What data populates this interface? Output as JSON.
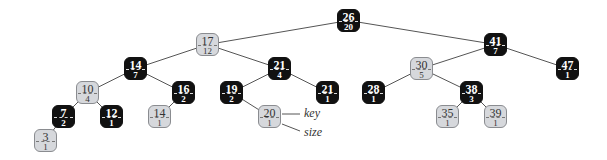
{
  "diagram": {
    "type": "red-black BST with subtree sizes",
    "colors": {
      "black_node": "#111111",
      "light_node": "#d6d8dc",
      "edge": "#555555"
    },
    "nodes": [
      {
        "id": "n26",
        "key": "26",
        "size": "20",
        "color": "black",
        "x": 337,
        "y": 9
      },
      {
        "id": "n17",
        "key": "17",
        "size": "12",
        "color": "light",
        "x": 196,
        "y": 33
      },
      {
        "id": "n41",
        "key": "41",
        "size": "7",
        "color": "black",
        "x": 484,
        "y": 33
      },
      {
        "id": "n14",
        "key": "14",
        "size": "7",
        "color": "black",
        "x": 124,
        "y": 57
      },
      {
        "id": "n21a",
        "key": "21",
        "size": "4",
        "color": "black",
        "x": 268,
        "y": 57
      },
      {
        "id": "n30",
        "key": "30",
        "size": "5",
        "color": "light",
        "x": 410,
        "y": 57
      },
      {
        "id": "n47",
        "key": "47",
        "size": "1",
        "color": "black",
        "x": 556,
        "y": 57
      },
      {
        "id": "n10",
        "key": "10",
        "size": "4",
        "color": "light",
        "x": 76,
        "y": 81
      },
      {
        "id": "n16",
        "key": "16",
        "size": "2",
        "color": "black",
        "x": 172,
        "y": 81
      },
      {
        "id": "n19",
        "key": "19",
        "size": "2",
        "color": "black",
        "x": 220,
        "y": 81
      },
      {
        "id": "n21b",
        "key": "21",
        "size": "1",
        "color": "black",
        "x": 316,
        "y": 81
      },
      {
        "id": "n28",
        "key": "28",
        "size": "1",
        "color": "black",
        "x": 362,
        "y": 81
      },
      {
        "id": "n38",
        "key": "38",
        "size": "3",
        "color": "black",
        "x": 460,
        "y": 81
      },
      {
        "id": "n7",
        "key": "7",
        "size": "2",
        "color": "black",
        "x": 52,
        "y": 105
      },
      {
        "id": "n12",
        "key": "12",
        "size": "1",
        "color": "black",
        "x": 100,
        "y": 105
      },
      {
        "id": "n14b",
        "key": "14",
        "size": "1",
        "color": "light",
        "x": 148,
        "y": 105
      },
      {
        "id": "n20",
        "key": "20",
        "size": "1",
        "color": "light",
        "x": 258,
        "y": 105
      },
      {
        "id": "n35",
        "key": "35",
        "size": "1",
        "color": "light",
        "x": 436,
        "y": 105
      },
      {
        "id": "n39",
        "key": "39",
        "size": "1",
        "color": "light",
        "x": 484,
        "y": 105
      },
      {
        "id": "n3",
        "key": "3",
        "size": "1",
        "color": "light",
        "x": 34,
        "y": 129
      }
    ],
    "edges": [
      [
        "n26",
        "n17"
      ],
      [
        "n26",
        "n41"
      ],
      [
        "n17",
        "n14"
      ],
      [
        "n17",
        "n21a"
      ],
      [
        "n41",
        "n30"
      ],
      [
        "n41",
        "n47"
      ],
      [
        "n14",
        "n10"
      ],
      [
        "n14",
        "n16"
      ],
      [
        "n21a",
        "n19"
      ],
      [
        "n21a",
        "n21b"
      ],
      [
        "n30",
        "n28"
      ],
      [
        "n30",
        "n38"
      ],
      [
        "n10",
        "n7"
      ],
      [
        "n10",
        "n12"
      ],
      [
        "n16",
        "n14b"
      ],
      [
        "n19",
        "n20"
      ],
      [
        "n38",
        "n35"
      ],
      [
        "n38",
        "n39"
      ],
      [
        "n7",
        "n3"
      ]
    ],
    "annotations": {
      "key_label": "key",
      "size_label": "size"
    }
  }
}
